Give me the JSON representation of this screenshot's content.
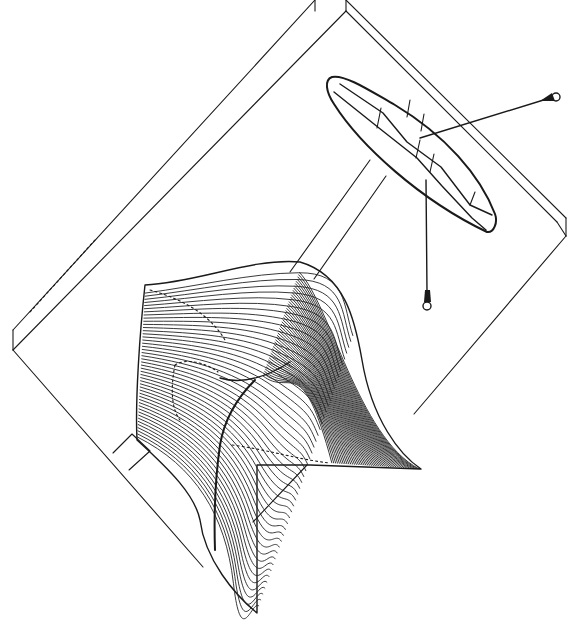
{
  "figure": {
    "type": "technical-line-drawing",
    "description": "Isometric patent-style drawing of a rotated rectangular slab with a lens-shaped element carrying two lead wires ending in eyelets, and a ribbed three-dimensional wave surface rising from the lower part of the slab",
    "background_color": "#ffffff",
    "line_color": "#1a1a1a"
  },
  "components": {
    "plate": {
      "label": "slab-plate"
    },
    "rails": {
      "label": "support-rails"
    },
    "lens": {
      "label": "lens-element"
    },
    "wire_right": {
      "label": "lead-wire-right"
    },
    "wire_down": {
      "label": "lead-wire-down"
    },
    "surface": {
      "label": "wave-surface",
      "rib_count": 48
    }
  }
}
